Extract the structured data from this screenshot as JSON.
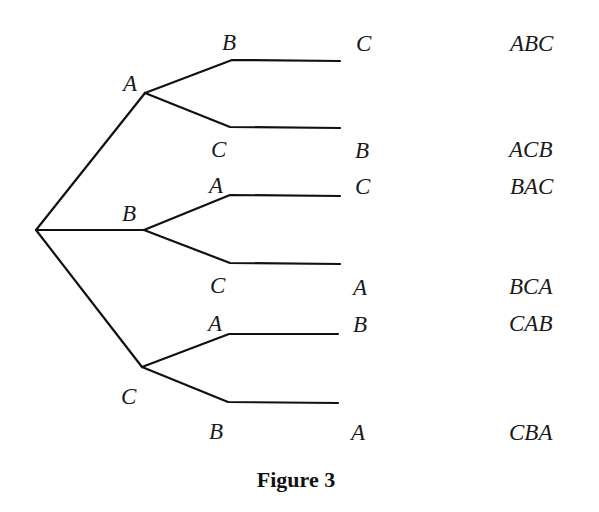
{
  "figure": {
    "caption": "Figure 3",
    "type": "tree-diagram"
  },
  "tree": {
    "level1": [
      {
        "label": "A",
        "level2": [
          {
            "label": "B",
            "level3": "C",
            "result": "ABC"
          },
          {
            "label": "C",
            "level3": "B",
            "result": "ACB"
          }
        ]
      },
      {
        "label": "B",
        "level2": [
          {
            "label": "A",
            "level3": "C",
            "result": "BAC"
          },
          {
            "label": "C",
            "level3": "A",
            "result": "BCA"
          }
        ]
      },
      {
        "label": "C",
        "level2": [
          {
            "label": "A",
            "level3": "B",
            "result": "CAB"
          },
          {
            "label": "B",
            "level3": "A",
            "result": "CBA"
          }
        ]
      }
    ]
  },
  "colors": {
    "line": "#111111",
    "text": "#1a1a1a",
    "background": "#ffffff"
  }
}
